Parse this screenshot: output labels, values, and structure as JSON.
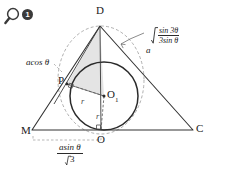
{
  "figure": {
    "kind": "geometry-diagram",
    "background_color": "#ffffff",
    "stroke_color": "#2a2a2a",
    "dashed_color": "#8c8c8c",
    "shade_color": "#e2e2e2",
    "badge": {
      "icon": "magnifier-icon",
      "number": "1"
    },
    "vertices": [
      {
        "id": "D",
        "label": "D",
        "x": 100,
        "y": 22
      },
      {
        "id": "M",
        "label": "M",
        "x": 30,
        "y": 131
      },
      {
        "id": "C",
        "label": "C",
        "x": 197,
        "y": 129
      },
      {
        "id": "O",
        "label": "O",
        "x": 101,
        "y": 133
      },
      {
        "id": "P",
        "label": "P",
        "x": 67,
        "y": 81
      },
      {
        "id": "O1",
        "label": "O",
        "sub": "1",
        "x": 104,
        "y": 96
      }
    ],
    "segment_labels": [
      {
        "id": "r-horizontal",
        "label": "r"
      },
      {
        "id": "r-vertical",
        "label": "r"
      }
    ],
    "expressions": {
      "hypotenuse": {
        "coefficient": "a",
        "radical_numerator": "sin 3θ",
        "radical_denominator": "3sin θ"
      },
      "side_left": "acos θ",
      "base": {
        "numerator": "asin θ",
        "denominator": "3",
        "denominator_has_radical": true
      }
    }
  }
}
